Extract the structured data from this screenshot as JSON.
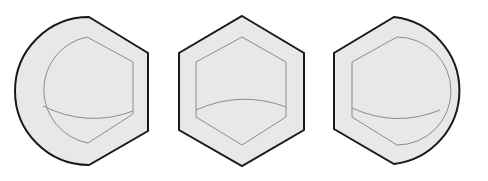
{
  "diagram": {
    "colors": {
      "background": "#ffffff",
      "fill": "#e8e8e8",
      "outline": "#1a1a1a",
      "inner_line": "#8c8c8c"
    },
    "shapes": [
      {
        "id": "left-rounded-hex",
        "rounded_side": "left"
      },
      {
        "id": "center-hex",
        "rounded_side": "none"
      },
      {
        "id": "right-rounded-hex",
        "rounded_side": "right"
      }
    ]
  }
}
